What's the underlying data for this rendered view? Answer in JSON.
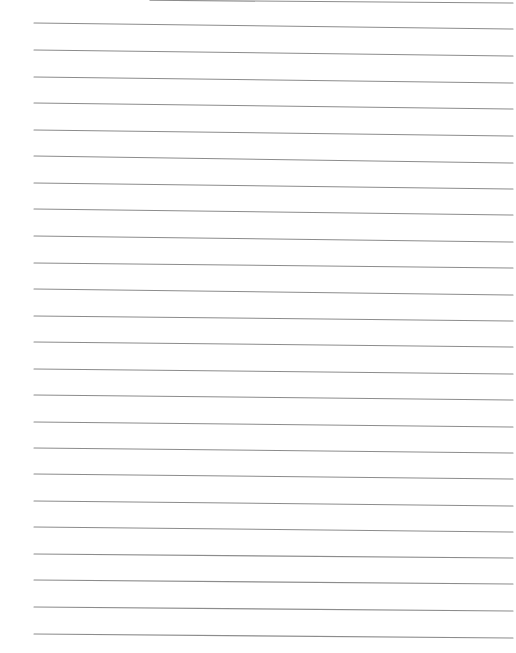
{
  "page": {
    "type": "lined-paper",
    "background": "#ffffff",
    "line_color": "#8c8c8c",
    "line_width": 1.1,
    "lines": [
      {
        "x1": 150,
        "y1": 0.3,
        "x2": 513,
        "y2": 3
      },
      {
        "x1": 34,
        "y1": 23,
        "x2": 513,
        "y2": 29
      },
      {
        "x1": 34,
        "y1": 50,
        "x2": 513,
        "y2": 56
      },
      {
        "x1": 34,
        "y1": 77,
        "x2": 513,
        "y2": 83
      },
      {
        "x1": 34,
        "y1": 103,
        "x2": 513,
        "y2": 109
      },
      {
        "x1": 34,
        "y1": 130,
        "x2": 513,
        "y2": 136
      },
      {
        "x1": 34,
        "y1": 156,
        "x2": 513,
        "y2": 163
      },
      {
        "x1": 34,
        "y1": 183,
        "x2": 513,
        "y2": 189
      },
      {
        "x1": 34,
        "y1": 209,
        "x2": 513,
        "y2": 215
      },
      {
        "x1": 34,
        "y1": 236,
        "x2": 513,
        "y2": 242
      },
      {
        "x1": 34,
        "y1": 263,
        "x2": 513,
        "y2": 268
      },
      {
        "x1": 34,
        "y1": 289,
        "x2": 513,
        "y2": 295
      },
      {
        "x1": 34,
        "y1": 316,
        "x2": 513,
        "y2": 321
      },
      {
        "x1": 34,
        "y1": 342,
        "x2": 513,
        "y2": 347
      },
      {
        "x1": 34,
        "y1": 369,
        "x2": 513,
        "y2": 374
      },
      {
        "x1": 34,
        "y1": 395,
        "x2": 513,
        "y2": 400
      },
      {
        "x1": 34,
        "y1": 422,
        "x2": 513,
        "y2": 427
      },
      {
        "x1": 34,
        "y1": 448,
        "x2": 513,
        "y2": 453
      },
      {
        "x1": 34,
        "y1": 474,
        "x2": 513,
        "y2": 479
      },
      {
        "x1": 34,
        "y1": 501,
        "x2": 513,
        "y2": 506
      },
      {
        "x1": 34,
        "y1": 527,
        "x2": 513,
        "y2": 532
      },
      {
        "x1": 34,
        "y1": 554,
        "x2": 513,
        "y2": 558
      },
      {
        "x1": 34,
        "y1": 580,
        "x2": 513,
        "y2": 584
      },
      {
        "x1": 34,
        "y1": 607,
        "x2": 513,
        "y2": 611
      },
      {
        "x1": 34,
        "y1": 634,
        "x2": 513,
        "y2": 638
      }
    ]
  }
}
